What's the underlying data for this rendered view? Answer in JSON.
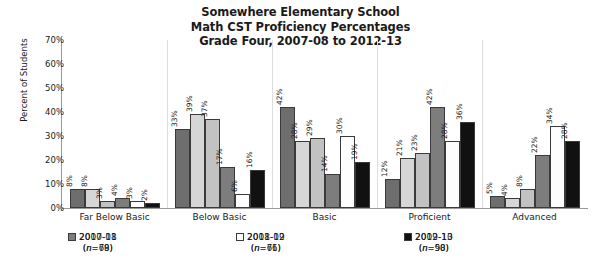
{
  "chart_data": {
    "type": "bar",
    "title": "Somewhere Elementary School\nMath CST Proficiency Percentages\nGrade Four, 2007-08 to 2012-13",
    "title_lines": [
      "Somewhere Elementary School",
      "Math CST Proficiency Percentages",
      "Grade Four, 2007-08 to 2012-13"
    ],
    "xlabel": "",
    "ylabel": "Percent of Students",
    "ylim": [
      0,
      70
    ],
    "ytick_labels": [
      "70%",
      "60%",
      "50%",
      "40%",
      "30%",
      "20%",
      "10%",
      "0%"
    ],
    "ytick_values": [
      70,
      60,
      50,
      40,
      30,
      20,
      10,
      0
    ],
    "grid": false,
    "legend_position": "bottom",
    "categories": [
      "Far Below Basic",
      "Below Basic",
      "Basic",
      "Proficient",
      "Advanced"
    ],
    "series": [
      {
        "name": "2007-08",
        "n": "(n=78)",
        "n_value": 78,
        "color": "#6e6e6e",
        "values": [
          8,
          33,
          42,
          12,
          5
        ],
        "labels": [
          "8%",
          "33%",
          "42%",
          "12%",
          "5%"
        ]
      },
      {
        "name": "2008-09",
        "n": "(n=76)",
        "n_value": 76,
        "color": "#d6d6d6",
        "values": [
          8,
          39,
          28,
          21,
          4
        ],
        "labels": [
          "8%",
          "39%",
          "28%",
          "21%",
          "4%"
        ]
      },
      {
        "name": "2009-10",
        "n": "(n=90)",
        "n_value": 90,
        "color": "#c2c2c2",
        "values": [
          3,
          37,
          29,
          23,
          8
        ],
        "labels": [
          "3%",
          "37%",
          "29%",
          "23%",
          "8%"
        ]
      },
      {
        "name": "2010-11",
        "n": "(n=69)",
        "n_value": 69,
        "color": "#7d7d7d",
        "values": [
          4,
          17,
          14,
          42,
          22
        ],
        "labels": [
          "4%",
          "17%",
          "14%",
          "42%",
          "22%"
        ]
      },
      {
        "name": "2011-12",
        "n": "(n=61)",
        "n_value": 61,
        "color": "#fdfdfd",
        "values": [
          3,
          6,
          30,
          28,
          34
        ],
        "labels": [
          "3%",
          "6%",
          "30%",
          "28%",
          "34%"
        ]
      },
      {
        "name": "2012-13",
        "n": "(n=58)",
        "n_value": 58,
        "color": "#111111",
        "values": [
          2,
          16,
          19,
          36,
          28
        ],
        "labels": [
          "2%",
          "16%",
          "19%",
          "36%",
          "28%"
        ]
      }
    ]
  }
}
